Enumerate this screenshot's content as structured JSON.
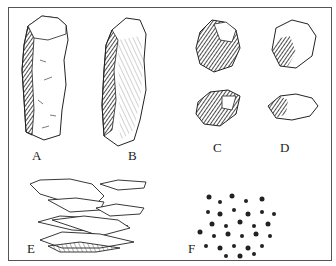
{
  "figure": {
    "panels": [
      {
        "id": "A",
        "label": "A",
        "subject": "elongated columnar rock fragment, top-face view"
      },
      {
        "id": "B",
        "label": "B",
        "subject": "elongated columnar rock fragment, side view"
      },
      {
        "id": "C",
        "label": "C",
        "subject": "two blocky angular rock fragments"
      },
      {
        "id": "D",
        "label": "D",
        "subject": "two rounded lumpy rock fragments"
      },
      {
        "id": "E",
        "label": "E",
        "subject": "stacked thin platy/flaky layers"
      },
      {
        "id": "F",
        "label": "F",
        "subject": "cluster of small granular particles"
      }
    ],
    "colors": {
      "ink": "#222222",
      "shade": "#444444",
      "paper": "#ffffff",
      "border": "#555555"
    }
  }
}
